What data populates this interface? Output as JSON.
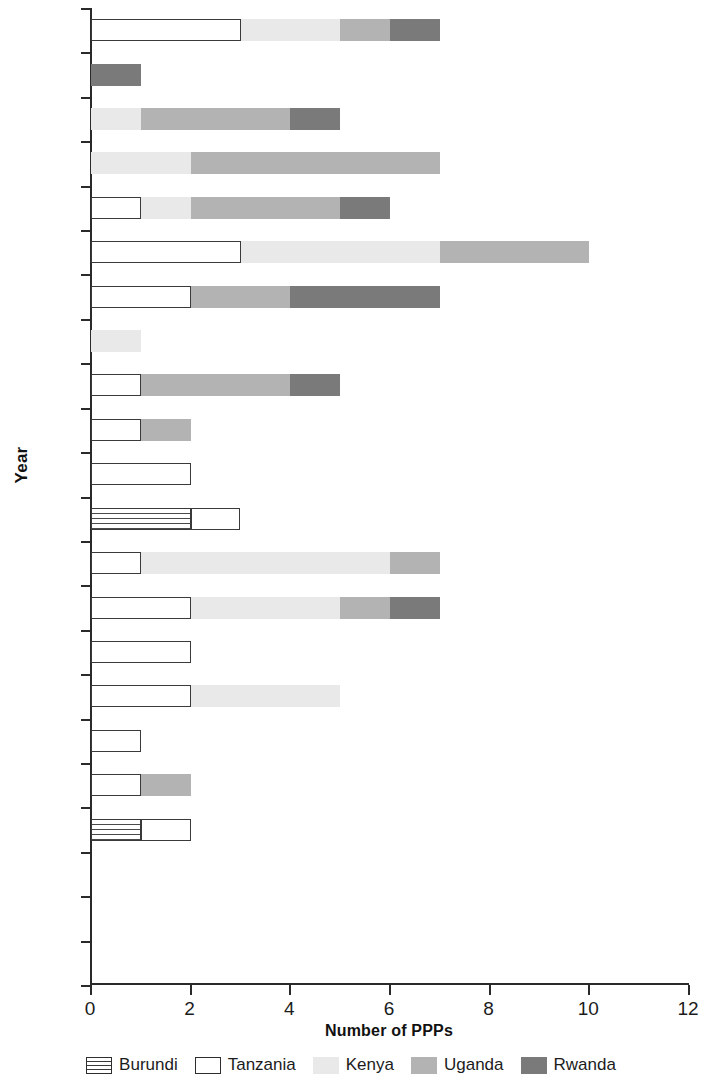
{
  "chart": {
    "y_axis_title": "Year",
    "x_axis_title": "Number of PPPs"
  },
  "legend": {
    "items": [
      {
        "label": "Burundi",
        "key": "burundi",
        "swatch": "burundi-swatch"
      },
      {
        "label": "Tanzania",
        "key": "tanzania",
        "swatch": "tanzania-swatch"
      },
      {
        "label": "Kenya",
        "key": "kenya",
        "swatch": "kenya-swatch"
      },
      {
        "label": "Uganda",
        "key": "uganda",
        "swatch": "uganda-swatch"
      },
      {
        "label": "Rwanda",
        "key": "rwanda",
        "swatch": "rwanda-swatch"
      }
    ]
  },
  "chart_data": {
    "type": "bar",
    "orientation": "horizontal",
    "stacked": true,
    "title": "",
    "xlabel": "Number of PPPs",
    "ylabel": "Year",
    "xlim": [
      0,
      12
    ],
    "xticks": [
      0,
      2,
      4,
      6,
      8,
      10,
      12
    ],
    "xtick_labels": [
      "0",
      "2",
      "4",
      "6",
      "8",
      "10",
      "12"
    ],
    "grid": false,
    "legend_position": "bottom",
    "categories": [
      "2011",
      "2010",
      "2009",
      "2008",
      "2007",
      "2006",
      "2005",
      "2004",
      "2003",
      "2002",
      "2001",
      "2000",
      "1999",
      "1998",
      "1997",
      "1996",
      "1995",
      "1994",
      "1993",
      "1992",
      "1991",
      "1990"
    ],
    "series": [
      {
        "name": "Burundi",
        "color": "#ffffff",
        "pattern": "horizontal-stripes",
        "values": [
          0,
          0,
          0,
          0,
          0,
          0,
          0,
          0,
          0,
          0,
          0,
          2,
          0,
          0,
          0,
          0,
          0,
          0,
          1,
          0,
          0,
          0
        ]
      },
      {
        "name": "Tanzania",
        "color": "#ffffff",
        "pattern": "outline",
        "values": [
          3,
          0,
          0,
          0,
          1,
          3,
          2,
          0,
          1,
          1,
          2,
          1,
          1,
          2,
          2,
          2,
          1,
          1,
          1,
          0,
          0,
          0
        ]
      },
      {
        "name": "Kenya",
        "color": "#e9e9e9",
        "pattern": "solid",
        "values": [
          2,
          0,
          1,
          2,
          1,
          4,
          0,
          1,
          0,
          0,
          0,
          0,
          5,
          3,
          0,
          3,
          0,
          0,
          0,
          0,
          0,
          0
        ]
      },
      {
        "name": "Uganda",
        "color": "#b3b3b3",
        "pattern": "solid",
        "values": [
          1,
          0,
          3,
          5,
          3,
          3,
          2,
          0,
          3,
          1,
          0,
          0,
          1,
          1,
          0,
          0,
          0,
          1,
          0,
          0,
          0,
          0
        ]
      },
      {
        "name": "Rwanda",
        "color": "#7a7a7a",
        "pattern": "solid",
        "values": [
          1,
          1,
          1,
          0,
          1,
          0,
          3,
          0,
          1,
          0,
          0,
          0,
          0,
          1,
          0,
          0,
          0,
          0,
          0,
          0,
          0,
          0
        ]
      }
    ],
    "totals": [
      7,
      1,
      5,
      7,
      6,
      10,
      7,
      1,
      5,
      2,
      2,
      3,
      7,
      7,
      2,
      5,
      1,
      2,
      2,
      0,
      0,
      0
    ]
  }
}
